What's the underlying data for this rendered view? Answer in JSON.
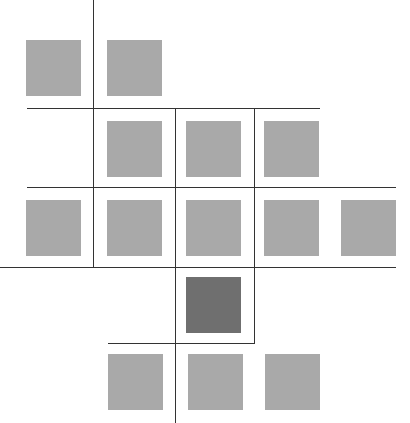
{
  "diagram": {
    "title": "",
    "colors": {
      "cell": "#a9a9a9",
      "highlight": "#6f6f6f",
      "line": "#333333",
      "background": "#ffffff"
    },
    "cells": [
      {
        "id": "r1c1",
        "x": 26,
        "y": 40,
        "highlight": false
      },
      {
        "id": "r1c2",
        "x": 107,
        "y": 40,
        "highlight": false
      },
      {
        "id": "r2c2",
        "x": 107,
        "y": 121,
        "highlight": false
      },
      {
        "id": "r2c3",
        "x": 186,
        "y": 121,
        "highlight": false
      },
      {
        "id": "r2c4",
        "x": 264,
        "y": 121,
        "highlight": false
      },
      {
        "id": "r3c1",
        "x": 26,
        "y": 200,
        "highlight": false
      },
      {
        "id": "r3c2",
        "x": 107,
        "y": 200,
        "highlight": false
      },
      {
        "id": "r3c3",
        "x": 186,
        "y": 200,
        "highlight": false
      },
      {
        "id": "r3c4",
        "x": 264,
        "y": 200,
        "highlight": false
      },
      {
        "id": "r3c5",
        "x": 341,
        "y": 200,
        "highlight": false
      },
      {
        "id": "r4c3",
        "x": 186,
        "y": 277,
        "highlight": true
      },
      {
        "id": "r5c2",
        "x": 108,
        "y": 354,
        "highlight": false
      },
      {
        "id": "r5c3",
        "x": 188,
        "y": 354,
        "highlight": false
      },
      {
        "id": "r5c4",
        "x": 265,
        "y": 354,
        "highlight": false
      }
    ],
    "hlines": [
      {
        "x": 27,
        "y": 108,
        "w": 293
      },
      {
        "x": 27,
        "y": 187,
        "w": 369
      },
      {
        "x": 0,
        "y": 267,
        "w": 396
      },
      {
        "x": 108,
        "y": 343,
        "w": 147
      }
    ],
    "vlines": [
      {
        "x": 93,
        "y": 0,
        "h": 267
      },
      {
        "x": 175,
        "y": 108,
        "h": 315
      },
      {
        "x": 254,
        "y": 108,
        "h": 235
      }
    ]
  }
}
